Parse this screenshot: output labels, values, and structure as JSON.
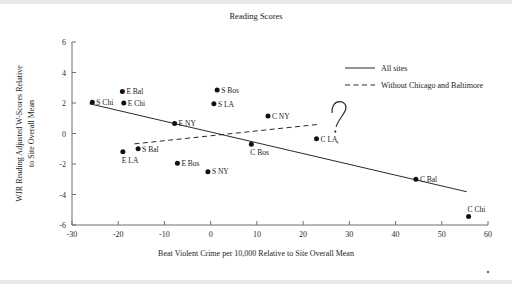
{
  "chart_data": {
    "type": "scatter",
    "title": "Reading Scores",
    "xlabel": "Beat Violent Crime per 10,000 Relative to Site Overall Mean",
    "ylabel": "WJR Reading Adjusted W-Scores Relative to Site Overall Mean",
    "xlim": [
      -30,
      60
    ],
    "ylim": [
      -6,
      6
    ],
    "xticks": [
      -30,
      -20,
      -10,
      0,
      10,
      20,
      30,
      40,
      50,
      60
    ],
    "xtick_labels": [
      "-30",
      "-20",
      "-10",
      "0",
      "10",
      "20",
      "30",
      "40",
      "50",
      "60"
    ],
    "yticks": [
      -6,
      -4,
      -2,
      0,
      2,
      4,
      6
    ],
    "ytick_labels": [
      "-6",
      "-4",
      "-2",
      "0",
      "2",
      "4",
      "6"
    ],
    "grid": false,
    "legend_position": "upper right",
    "points": [
      {
        "label": "S Chi",
        "x": -25.6,
        "y": 2.05,
        "label_side": "right"
      },
      {
        "label": "E Bal",
        "x": -19.1,
        "y": 2.75,
        "label_side": "right"
      },
      {
        "label": "E Chi",
        "x": -18.8,
        "y": 2.0,
        "label_side": "right"
      },
      {
        "label": "E LA",
        "x": -19.0,
        "y": -1.2,
        "label_side": "below"
      },
      {
        "label": "S Bal",
        "x": -15.7,
        "y": -1.0,
        "label_side": "right"
      },
      {
        "label": "E NY",
        "x": -7.8,
        "y": 0.65,
        "label_side": "right"
      },
      {
        "label": "E Bos",
        "x": -7.2,
        "y": -1.95,
        "label_side": "right"
      },
      {
        "label": "S NY",
        "x": -0.6,
        "y": -2.5,
        "label_side": "right"
      },
      {
        "label": "S Bos",
        "x": 1.4,
        "y": 2.85,
        "label_side": "right"
      },
      {
        "label": "S LA",
        "x": 0.7,
        "y": 1.95,
        "label_side": "right"
      },
      {
        "label": "C Bos",
        "x": 8.8,
        "y": -0.7,
        "label_side": "below"
      },
      {
        "label": "C NY",
        "x": 12.4,
        "y": 1.15,
        "label_side": "right"
      },
      {
        "label": "C LA",
        "x": 22.9,
        "y": -0.35,
        "label_side": "right"
      },
      {
        "label": "C Bal",
        "x": 44.4,
        "y": -3.0,
        "label_side": "right"
      },
      {
        "label": "C Chi",
        "x": 55.8,
        "y": -5.45,
        "label_side": "above"
      }
    ],
    "series": [
      {
        "name": "All sites",
        "type": "line",
        "style": "solid",
        "x": [
          -26.2,
          55.4
        ],
        "y": [
          1.95,
          -3.82
        ]
      },
      {
        "name": "Without Chicago and Baltimore",
        "type": "line",
        "style": "dashed",
        "x": [
          -16.5,
          23.4
        ],
        "y": [
          -0.68,
          0.6
        ]
      }
    ],
    "annotations": [
      {
        "name": "handwritten-question-mark",
        "text": "?",
        "x": 30.5,
        "y": 1.6
      }
    ]
  },
  "legend": {
    "entries": [
      {
        "label": "All sites",
        "style": "solid"
      },
      {
        "label": "Without Chicago and Baltimore",
        "style": "dashed"
      }
    ]
  }
}
